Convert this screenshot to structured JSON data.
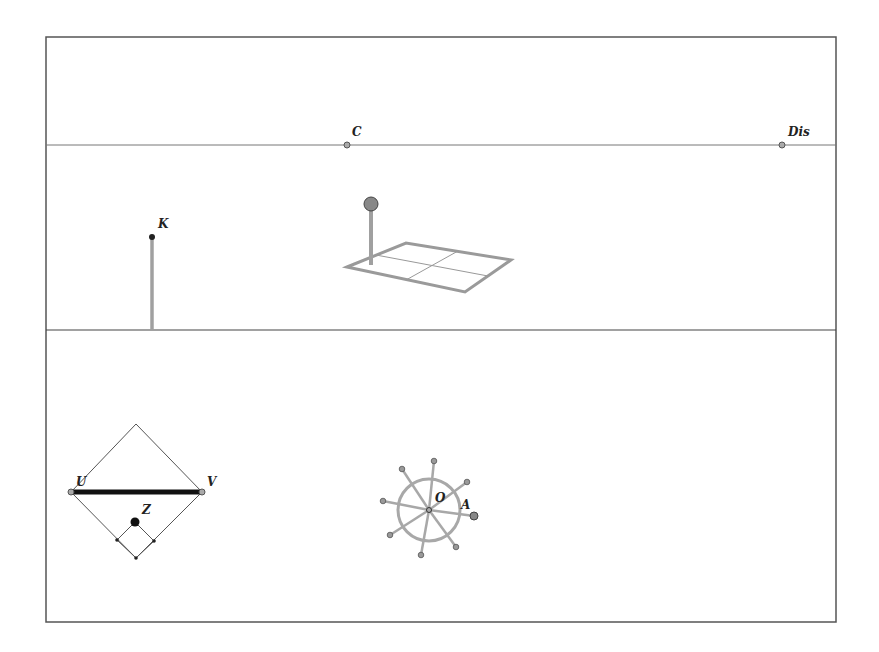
{
  "frame": {
    "x": 46,
    "y": 37,
    "width": 790,
    "height": 585,
    "stroke": "#555555"
  },
  "divider_line": {
    "y": 330
  },
  "top_line": {
    "y": 145
  },
  "labels": {
    "C": "C",
    "Dis": "Dis",
    "K": "K",
    "U": "U",
    "V": "V",
    "Z": "Z",
    "O": "O",
    "A": "A"
  },
  "points": {
    "C": {
      "x": 347,
      "y": 145
    },
    "Dis": {
      "x": 782,
      "y": 145
    },
    "K": {
      "x": 152,
      "y": 237
    },
    "U": {
      "x": 71,
      "y": 492
    },
    "V": {
      "x": 202,
      "y": 492
    },
    "Z": {
      "x": 135,
      "y": 522
    },
    "O": {
      "x": 429,
      "y": 510
    },
    "A": {
      "x": 474,
      "y": 516
    }
  },
  "colors": {
    "line": "#666666",
    "gray_thick": "#a0a0a0",
    "point_fill": "#999999",
    "dark": "#111111"
  }
}
